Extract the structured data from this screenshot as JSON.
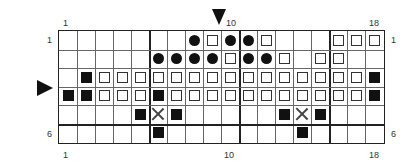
{
  "chart_title": "",
  "labels": {
    "top_left": "1",
    "top_mid": "10",
    "top_right": "18",
    "bottom_left": "1",
    "bottom_mid": "10",
    "bottom_right": "18",
    "row_first_left": "1",
    "row_first_right": "1",
    "row_last_left": "6",
    "row_last_right": "6"
  },
  "markers": {
    "column_marker": "triangle-down at column 10",
    "row_marker": "triangle-right between rows 3 and 4"
  },
  "legend_symbols": {
    "dot": "filled circle",
    "open": "open square",
    "fill": "filled square",
    "x": "cross",
    "empty": "blank"
  },
  "grid": {
    "columns": 18,
    "rows": 6,
    "thick_columns_after": [
      5,
      10,
      15
    ],
    "thick_rows_after": [
      5
    ],
    "cells": [
      [
        "",
        "",
        "",
        "",
        "",
        "",
        "",
        "dot",
        "open",
        "dot",
        "dot",
        "open",
        "",
        "",
        "",
        "open",
        "open",
        "open"
      ],
      [
        "",
        "",
        "",
        "",
        "",
        "dot",
        "dot",
        "dot",
        "dot",
        "open",
        "dot",
        "dot",
        "open",
        "",
        "open",
        "open",
        "",
        ""
      ],
      [
        "",
        "fill",
        "open",
        "open",
        "open",
        "open",
        "open",
        "open",
        "open",
        "open",
        "open",
        "open",
        "open",
        "open",
        "open",
        "open",
        "open",
        "fill"
      ],
      [
        "fill",
        "fill",
        "open",
        "open",
        "open",
        "fill",
        "open",
        "open",
        "open",
        "open",
        "open",
        "open",
        "open",
        "open",
        "open",
        "open",
        "open",
        "fill"
      ],
      [
        "",
        "",
        "",
        "",
        "fill",
        "x",
        "fill",
        "",
        "",
        "",
        "",
        "",
        "fill",
        "x",
        "fill",
        "",
        "",
        ""
      ],
      [
        "",
        "",
        "",
        "",
        "",
        "fill",
        "",
        "",
        "",
        "",
        "",
        "",
        "",
        "fill",
        "",
        "",
        "",
        ""
      ]
    ]
  }
}
